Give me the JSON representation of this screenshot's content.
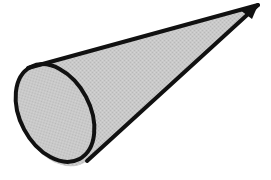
{
  "figure": {
    "kind": "line-art-illustration",
    "subject_label": "cone",
    "title": "",
    "caption": "",
    "annotations": [],
    "canvas": {
      "width": 271,
      "height": 180,
      "background_color": "#ffffff"
    },
    "style": {
      "outline_color": "#111111",
      "outline_width_px": 4,
      "fill_color": "#c9c9c9",
      "fill_texture": "fine-dither-halftone",
      "fill_texture_dark": "#b9b9b9",
      "fill_texture_light": "#d4d4d4"
    },
    "geometry": {
      "description": "Right circular cone viewed obliquely, circular base rendered as a tilted ellipse at lower left, apex a sharp point at upper right.",
      "apex": {
        "x": 258,
        "y": 5
      },
      "base_ellipse": {
        "center_x": 55,
        "center_y": 113,
        "radius_x": 35,
        "radius_y": 52,
        "rotation_deg": -28
      },
      "upper_tangent_point": {
        "x": 28,
        "y": 68
      },
      "lower_tangent_point": {
        "x": 87,
        "y": 161
      }
    }
  }
}
